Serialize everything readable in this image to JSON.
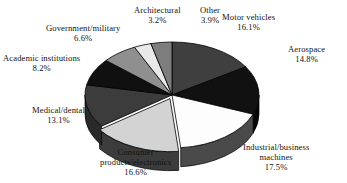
{
  "chart_data": {
    "type": "pie",
    "title": "",
    "subtitle": "",
    "xlabel": "",
    "ylabel": "",
    "legend_position": "none",
    "grid": false,
    "three_d": true,
    "labels_show_percent": true,
    "start_angle_deg": 0,
    "direction": "clockwise",
    "categories": [
      "Motor vehicles",
      "Aerospace",
      "Industrial/business machines",
      "Consumer products/electronics",
      "Medical/dental",
      "Academic institutions",
      "Government/military",
      "Architectural",
      "Other"
    ],
    "values": [
      16.1,
      14.8,
      17.5,
      16.6,
      13.1,
      8.2,
      6.6,
      3.2,
      3.9
    ],
    "units": "percent",
    "total": 100.0,
    "slices": [
      {
        "name": "Motor vehicles",
        "value": 16.1,
        "label": "Motor vehicles",
        "label_line2": "",
        "percent": "16.1%",
        "color": "#3f3f3f",
        "side_color": "#2e2e2e",
        "exploded": false
      },
      {
        "name": "Aerospace",
        "value": 14.8,
        "label": "Aerospace",
        "label_line2": "",
        "percent": "14.8%",
        "color": "#111111",
        "side_color": "#060606",
        "exploded": false
      },
      {
        "name": "Industrial/business machines",
        "value": 17.5,
        "label": "Industrial/business",
        "label_line2": "machines",
        "percent": "17.5%",
        "color": "#fdfdfd",
        "side_color": "#4a4a4a",
        "exploded": false
      },
      {
        "name": "Consumer products/electronics",
        "value": 16.6,
        "label": "Consumer",
        "label_line2": "products/electronics",
        "percent": "16.6%",
        "color": "#d3d3d3",
        "side_color": "#3c3c3c",
        "exploded": true
      },
      {
        "name": "Medical/dental",
        "value": 13.1,
        "label": "Medical/dental",
        "label_line2": "",
        "percent": "13.1%",
        "color": "#3c3c3c",
        "side_color": "#2a2a2a",
        "exploded": false
      },
      {
        "name": "Academic institutions",
        "value": 8.2,
        "label": "Academic institutions",
        "label_line2": "",
        "percent": "8.2%",
        "color": "#101010",
        "side_color": "#080808",
        "exploded": false
      },
      {
        "name": "Government/military",
        "value": 6.6,
        "label": "Government/military",
        "label_line2": "",
        "percent": "6.6%",
        "color": "#8f8f8f",
        "side_color": "#5e5e5e",
        "exploded": false
      },
      {
        "name": "Architectural",
        "value": 3.2,
        "label": "Architectural",
        "label_line2": "",
        "percent": "3.2%",
        "color": "#e9e9e9",
        "side_color": "#6a6a6a",
        "exploded": false
      },
      {
        "name": "Other",
        "value": 3.9,
        "label": "Other",
        "label_line2": "",
        "percent": "3.9%",
        "color": "#7d7d7d",
        "side_color": "#555555",
        "exploded": false
      }
    ]
  },
  "labels": {
    "motor": {
      "name": "Motor vehicles",
      "percent": "16.1%"
    },
    "aero": {
      "name": "Aerospace",
      "percent": "14.8%"
    },
    "indus": {
      "name": "Industrial/business",
      "name2": "machines",
      "percent": "17.5%"
    },
    "consumer": {
      "name": "Consumer",
      "name2": "products/electronics",
      "percent": "16.6%"
    },
    "medical": {
      "name": "Medical/dental",
      "percent": "13.1%"
    },
    "academic": {
      "name": "Academic institutions",
      "percent": "8.2%"
    },
    "govt": {
      "name": "Government/military",
      "percent": "6.6%"
    },
    "arch": {
      "name": "Architectural",
      "percent": "3.2%"
    },
    "other": {
      "name": "Other",
      "percent": "3.9%"
    }
  }
}
